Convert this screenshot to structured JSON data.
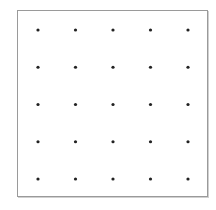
{
  "grid": {
    "rows": 5,
    "cols": 5,
    "dot_color": "#222222",
    "border_color": "#9a9a9a"
  }
}
